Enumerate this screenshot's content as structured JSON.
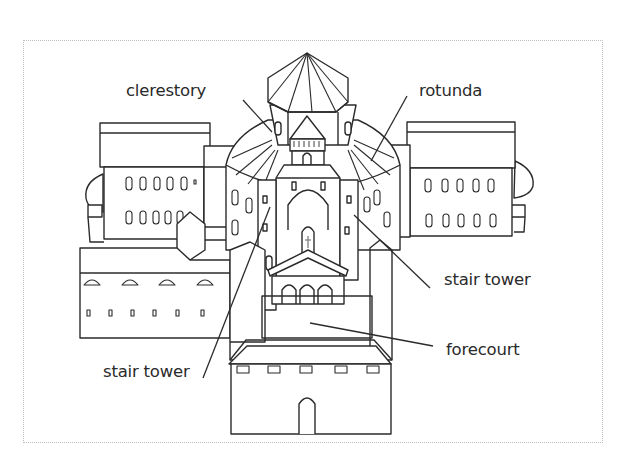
{
  "diagram": {
    "colors": {
      "line": "#2b2b2b",
      "label_text": "#2a2a2a",
      "frame_border": "#bdbdbd",
      "background": "#ffffff"
    },
    "labels": [
      {
        "id": "clerestory",
        "text": "clerestory"
      },
      {
        "id": "rotunda",
        "text": "rotunda"
      },
      {
        "id": "stair_tower_right",
        "text": "stair tower"
      },
      {
        "id": "forecourt",
        "text": "forecourt"
      },
      {
        "id": "stair_tower_left",
        "text": "stair tower"
      }
    ]
  }
}
